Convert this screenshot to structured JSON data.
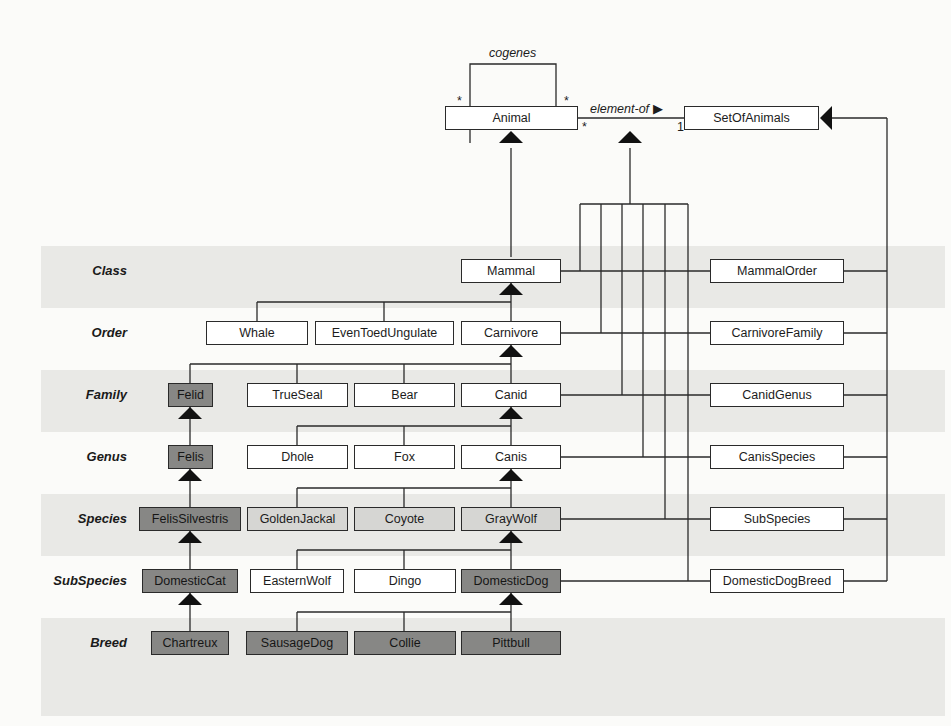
{
  "diagram": {
    "type": "UML class diagram - biological taxonomy with powertypes",
    "top": {
      "animal": "Animal",
      "set_of_animals": "SetOfAnimals",
      "self_association_label": "cogenes",
      "self_mult_left": "*",
      "self_mult_right": "*",
      "association_label": "element-of",
      "association_direction": "▶",
      "assoc_mult_animal": "*",
      "assoc_mult_set": "1"
    },
    "rows": [
      {
        "label": "Class",
        "shaded": true
      },
      {
        "label": "Order",
        "shaded": false
      },
      {
        "label": "Family",
        "shaded": true
      },
      {
        "label": "Genus",
        "shaded": false
      },
      {
        "label": "Species",
        "shaded": true
      },
      {
        "label": "SubSpecies",
        "shaded": false
      },
      {
        "label": "Breed",
        "shaded": true
      }
    ],
    "classes": {
      "mammal": "Mammal",
      "whale": "Whale",
      "even_toed_ungulate": "EvenToedUngulate",
      "carnivore": "Carnivore",
      "felid": "Felid",
      "true_seal": "TrueSeal",
      "bear": "Bear",
      "canid": "Canid",
      "felis": "Felis",
      "dhole": "Dhole",
      "fox": "Fox",
      "canis": "Canis",
      "felis_silvestris": "FelisSilvestris",
      "golden_jackal": "GoldenJackal",
      "coyote": "Coyote",
      "gray_wolf": "GrayWolf",
      "domestic_cat": "DomesticCat",
      "eastern_wolf": "EasternWolf",
      "dingo": "Dingo",
      "domestic_dog": "DomesticDog",
      "chartreux": "Chartreux",
      "sausage_dog": "SausageDog",
      "collie": "Collie",
      "pittbull": "Pittbull"
    },
    "powertypes": {
      "mammal_order": "MammalOrder",
      "carnivore_family": "CarnivoreFamily",
      "canid_genus": "CanidGenus",
      "canis_species": "CanisSpecies",
      "sub_species": "SubSpecies",
      "domestic_dog_breed": "DomesticDogBreed"
    },
    "colors": {
      "band": "#e9e9e6",
      "box_white": "#ffffff",
      "box_light": "#d6d6d3",
      "box_dark": "#878785",
      "line": "#2a2a2a"
    }
  }
}
